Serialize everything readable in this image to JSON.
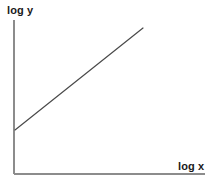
{
  "figure": {
    "width": 219,
    "height": 184,
    "background": "#ffffff"
  },
  "chart_data": {
    "type": "line",
    "title": "",
    "subtitle": "",
    "xlabel": "log x",
    "ylabel": "log y",
    "grid": false,
    "legend": null,
    "legend_position": "none",
    "ticks": {
      "x": [],
      "y": []
    },
    "xlim": [
      0,
      1
    ],
    "ylim": [
      0,
      1
    ],
    "annotations": [],
    "series": [
      {
        "name": "power-law trend",
        "color": "#4a4a4a",
        "linewidth": 1.2,
        "marker": "none",
        "x": [
          0.0,
          1.0
        ],
        "y": [
          0.29,
          0.95
        ],
        "pixel_start": [
          15,
          130
        ],
        "pixel_end": [
          143,
          28
        ]
      }
    ],
    "axes": {
      "color": "#8c8c8c",
      "linewidth": 2,
      "y_axis_pixels": {
        "x": 14,
        "y_top": 20,
        "y_bottom": 174
      },
      "x_axis_pixels": {
        "y": 174,
        "x_left": 14,
        "x_right": 205
      }
    }
  },
  "labels": {
    "y_axis": "log y",
    "x_axis": "log x"
  }
}
